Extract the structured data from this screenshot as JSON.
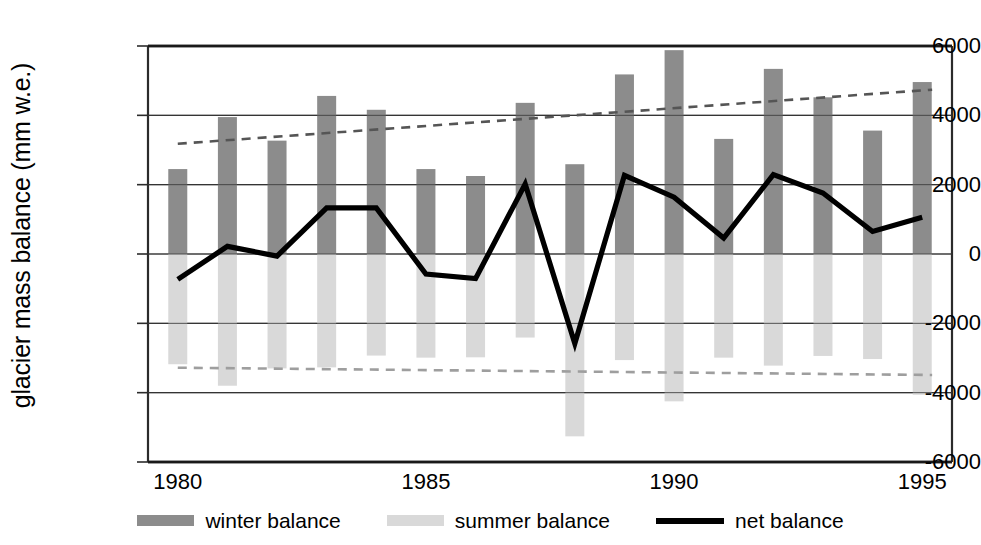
{
  "chart_data": {
    "type": "bar",
    "title": "",
    "xlabel": "",
    "ylabel": "glacier mass balance (mm w.e.)",
    "ylim": [
      -6000,
      6000
    ],
    "xlim": [
      1979.4,
      1995.6
    ],
    "yticks": [
      6000,
      4000,
      2000,
      0,
      -2000,
      -4000,
      -6000
    ],
    "ytick_labels": [
      "6000",
      "4000",
      "2000",
      "0",
      "-2000",
      "-4000",
      "-6000"
    ],
    "xticks": [
      1980,
      1985,
      1990,
      1995
    ],
    "xtick_labels": [
      "1980",
      "1985",
      "1990",
      "1995"
    ],
    "grid": true,
    "legend_position": "bottom",
    "categories": [
      1980,
      1981,
      1982,
      1983,
      1984,
      1985,
      1986,
      1987,
      1988,
      1989,
      1990,
      1991,
      1992,
      1993,
      1994,
      1995
    ],
    "series": [
      {
        "name": "winter balance",
        "type": "bar",
        "color": "#8c8c8c",
        "values": [
          2450,
          3950,
          3270,
          4560,
          4160,
          2450,
          2250,
          4360,
          2590,
          5180,
          5880,
          3320,
          5340,
          4520,
          3560,
          4960
        ]
      },
      {
        "name": "summer balance",
        "type": "bar",
        "color": "#d9d9d9",
        "values": [
          -3180,
          -3800,
          -3300,
          -3270,
          -2930,
          -2990,
          -2980,
          -2410,
          -5260,
          -3060,
          -4250,
          -2990,
          -3220,
          -2940,
          -3030,
          -4060
        ]
      },
      {
        "name": "net balance",
        "type": "line",
        "color": "#000000",
        "values": [
          -730,
          220,
          -60,
          1330,
          1330,
          -580,
          -710,
          2020,
          -2580,
          2270,
          1640,
          460,
          2290,
          1760,
          650,
          1060
        ]
      }
    ],
    "trendlines": [
      {
        "name": "winter balance trend",
        "style": "dashed",
        "color": "#555555",
        "x": [
          1980.0,
          1995.2
        ],
        "y": [
          3180,
          4740
        ]
      },
      {
        "name": "summer balance trend",
        "style": "dashed",
        "color": "#9e9e9e",
        "x": [
          1980.0,
          1995.2
        ],
        "y": [
          -3280,
          -3490
        ]
      }
    ],
    "legend": [
      {
        "label": "winter balance",
        "marker": "bar",
        "color": "#8c8c8c"
      },
      {
        "label": "summer balance",
        "marker": "bar",
        "color": "#d9d9d9"
      },
      {
        "label": "net balance",
        "marker": "line",
        "color": "#000000"
      }
    ]
  }
}
